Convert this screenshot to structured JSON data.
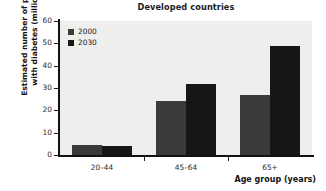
{
  "chart_data": {
    "type": "bar",
    "title": "Developed countries",
    "xlabel": "Age group (years)",
    "ylabel": "Estimated number of people with diabetes (millions)",
    "ylabel_line1": "Estimated number of people",
    "ylabel_line2": "with diabetes (millions)",
    "categories": [
      "20–44",
      "45–64",
      "65+"
    ],
    "series": [
      {
        "name": "2000",
        "values": [
          4.5,
          24,
          27
        ],
        "color": "#3a3a3a"
      },
      {
        "name": "2030",
        "values": [
          4.0,
          32,
          49
        ],
        "color": "#161616"
      }
    ],
    "ylim": [
      0,
      60
    ],
    "yticks": [
      0,
      10,
      20,
      30,
      40,
      50,
      60
    ],
    "ytick_labels": [
      "0",
      "10",
      "20",
      "30",
      "40",
      "50",
      "60"
    ],
    "grid": false,
    "legend_position": "top-left",
    "plot_background": "#eeeeec",
    "axis_color": "#121212"
  }
}
